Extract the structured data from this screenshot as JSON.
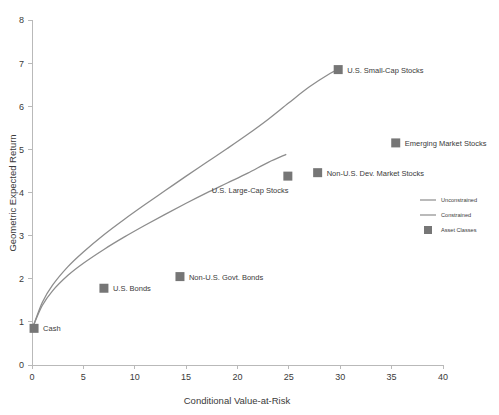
{
  "chart_data": {
    "type": "scatter",
    "title": "",
    "xlabel": "Conditional Value-at-Risk",
    "ylabel": "Geometric Expected Return",
    "xlim": [
      0,
      40
    ],
    "ylim": [
      0,
      8
    ],
    "xticks": [
      0,
      5,
      10,
      15,
      20,
      25,
      30,
      35,
      40
    ],
    "yticks": [
      0,
      1,
      2,
      3,
      4,
      5,
      6,
      7,
      8
    ],
    "grid": false,
    "legend_position": "right-middle",
    "points": [
      {
        "label": "Cash",
        "x": 0.2,
        "y": 0.85,
        "label_dx": 9,
        "label_dy": 3
      },
      {
        "label": "U.S. Bonds",
        "x": 7.0,
        "y": 1.78,
        "label_dx": 9,
        "label_dy": 3
      },
      {
        "label": "Non-U.S. Govt. Bonds",
        "x": 14.4,
        "y": 2.05,
        "label_dx": 9,
        "label_dy": 3
      },
      {
        "label": "U.S. Large-Cap Stocks",
        "x": 24.9,
        "y": 4.38,
        "label_dx": -76,
        "label_dy": 17
      },
      {
        "label": "Non-U.S. Dev. Market Stocks",
        "x": 27.8,
        "y": 4.46,
        "label_dx": 9,
        "label_dy": 3
      },
      {
        "label": "U.S. Small-Cap Stocks",
        "x": 29.8,
        "y": 6.85,
        "label_dx": 9,
        "label_dy": 3
      },
      {
        "label": "Emerging Market Stocks",
        "x": 35.4,
        "y": 5.15,
        "label_dx": 9,
        "label_dy": 3
      }
    ],
    "series": [
      {
        "name": "Unconstrained",
        "type": "line",
        "x": [
          0.2,
          1.0,
          2.0,
          3.5,
          5.0,
          7.0,
          9.0,
          11.0,
          13.0,
          15.0,
          17.0,
          19.0,
          21.0,
          23.0,
          25.0,
          27.0,
          29.0,
          29.8
        ],
        "y": [
          0.95,
          1.45,
          1.85,
          2.28,
          2.62,
          3.02,
          3.38,
          3.72,
          4.05,
          4.38,
          4.7,
          5.02,
          5.35,
          5.7,
          6.08,
          6.45,
          6.76,
          6.85
        ]
      },
      {
        "name": "Constrained",
        "type": "line",
        "x": [
          0.2,
          1.0,
          2.0,
          3.5,
          5.0,
          7.0,
          9.0,
          11.0,
          13.0,
          15.0,
          17.0,
          19.0,
          21.0,
          23.0,
          24.7
        ],
        "y": [
          0.95,
          1.38,
          1.72,
          2.08,
          2.36,
          2.68,
          2.97,
          3.24,
          3.5,
          3.75,
          3.99,
          4.22,
          4.45,
          4.7,
          4.88
        ]
      }
    ]
  },
  "legend": {
    "items": [
      {
        "label": "Unconstrained",
        "marker": "line"
      },
      {
        "label": "Constrained",
        "marker": "line"
      },
      {
        "label": "Asset Classes",
        "marker": "square"
      }
    ]
  },
  "colors": {
    "line": "#8d8d8d",
    "marker": "#767676",
    "axis": "#b9b9b9",
    "text": "#3a3a3a",
    "background": "#ffffff"
  }
}
